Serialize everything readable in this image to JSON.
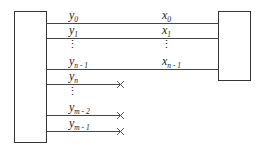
{
  "diagram": {
    "left_block": {
      "label": ""
    },
    "right_block": {
      "label": ""
    },
    "left_labels": [
      {
        "base": "y",
        "sub": "0"
      },
      {
        "base": "y",
        "sub": "1"
      },
      {
        "base": "y",
        "sub": "n - 1"
      },
      {
        "base": "y",
        "sub": "n"
      },
      {
        "base": "y",
        "sub": "m - 2"
      },
      {
        "base": "y",
        "sub": "m - 1"
      }
    ],
    "right_labels": [
      {
        "base": "x",
        "sub": "0"
      },
      {
        "base": "x",
        "sub": "1"
      },
      {
        "base": "x",
        "sub": "n - 1"
      }
    ],
    "ellipsis": "⋮",
    "connected_lines": 3,
    "unconnected_lines_marker": "×",
    "colors": {
      "line": "#444444",
      "box": "#333333",
      "text": "#222222"
    }
  }
}
